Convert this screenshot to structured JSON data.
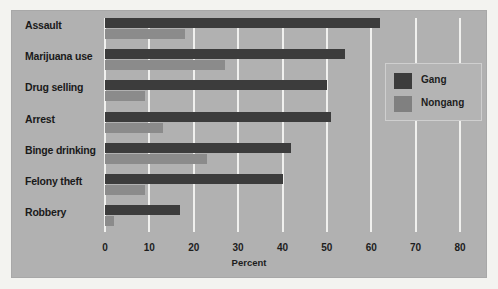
{
  "chart_data": {
    "type": "bar",
    "orientation": "horizontal",
    "title": "",
    "xlabel": "Percent",
    "ylabel": "",
    "xlim": [
      0,
      80
    ],
    "xticks": [
      0,
      10,
      20,
      30,
      40,
      50,
      60,
      70,
      80
    ],
    "grid": true,
    "legend_position": "right",
    "categories": [
      "Assault",
      "Marijuana use",
      "Drug selling",
      "Arrest",
      "Binge drinking",
      "Felony theft",
      "Robbery"
    ],
    "series": [
      {
        "name": "Gang",
        "color": "#3c3c3c",
        "values": [
          62,
          54,
          50,
          51,
          42,
          40,
          17
        ]
      },
      {
        "name": "Nongang",
        "color": "#8b8b8b",
        "values": [
          18,
          27,
          9,
          13,
          23,
          9,
          2
        ]
      }
    ]
  },
  "legend": {
    "items": [
      {
        "label": "Gang",
        "swatch": "gang"
      },
      {
        "label": "Nongang",
        "swatch": "nongang"
      }
    ]
  },
  "colors": {
    "panel_background": "#b1b1b1",
    "figure_background": "#f3f3f0",
    "gridline": "#f0f0ee",
    "gang_bar": "#3c3c3c",
    "nongang_bar": "#8b8b8b",
    "text": "#1a1a1a"
  }
}
